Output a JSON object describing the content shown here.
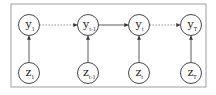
{
  "diagram": {
    "frame": {
      "x": 11,
      "y": 4,
      "w": 195,
      "h": 83,
      "stroke": "#888888"
    },
    "colors": {
      "stroke": "#333333",
      "label": "#222222",
      "dotted": "#777777"
    },
    "top_nodes": [
      {
        "id": "y1",
        "base": "y",
        "sub": "1",
        "cx": 29,
        "cy": 25
      },
      {
        "id": "yt-1",
        "base": "y",
        "sub": "t-1",
        "cx": 88,
        "cy": 25
      },
      {
        "id": "yt",
        "base": "y",
        "sub": "t",
        "cx": 139,
        "cy": 25
      },
      {
        "id": "yT",
        "base": "y",
        "sub": "T",
        "cx": 191,
        "cy": 25
      }
    ],
    "bottom_nodes": [
      {
        "id": "z1",
        "base": "z",
        "sub": "1",
        "cx": 29,
        "cy": 73
      },
      {
        "id": "zt-1",
        "base": "z",
        "sub": "t-1",
        "cx": 88,
        "cy": 73
      },
      {
        "id": "zt",
        "base": "z",
        "sub": "t",
        "cx": 139,
        "cy": 73
      },
      {
        "id": "zT",
        "base": "z",
        "sub": "T",
        "cx": 191,
        "cy": 73
      }
    ],
    "horizontal_edges": [
      {
        "from": "y1",
        "to": "yt-1",
        "style": "dotted"
      },
      {
        "from": "yt-1",
        "to": "yt",
        "style": "solid"
      },
      {
        "from": "yt",
        "to": "yT",
        "style": "dotted"
      }
    ],
    "vertical_edges": [
      {
        "from": "z1",
        "to": "y1"
      },
      {
        "from": "zt-1",
        "to": "yt-1"
      },
      {
        "from": "zt",
        "to": "yt"
      },
      {
        "from": "zT",
        "to": "yT"
      }
    ],
    "radius": 10.5
  }
}
